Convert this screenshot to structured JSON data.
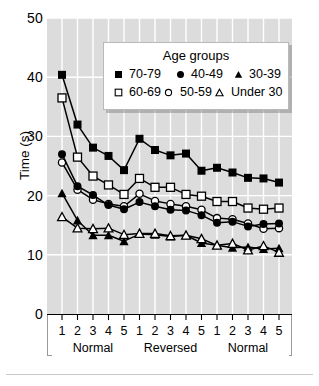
{
  "axes": {
    "ylabel": "Time (s)",
    "yticks": [
      "0",
      "10",
      "20",
      "30",
      "40",
      "50"
    ],
    "xticks": [
      "1",
      "2",
      "3",
      "4",
      "5",
      "1",
      "2",
      "3",
      "4",
      "5",
      "1",
      "2",
      "3",
      "4",
      "5"
    ],
    "xgroups": [
      "Normal",
      "Reversed",
      "Normal"
    ]
  },
  "legend": {
    "title": "Age groups",
    "items": [
      {
        "label": "70-79",
        "marker": "filled-square-marker"
      },
      {
        "label": "40-49",
        "marker": "filled-circle-marker"
      },
      {
        "label": "30-39",
        "marker": "filled-triangle-marker"
      },
      {
        "label": "60-69",
        "marker": "open-square-marker"
      },
      {
        "label": "50-59",
        "marker": "open-circle-marker"
      },
      {
        "label": "Under 30",
        "marker": "open-triangle-marker"
      }
    ]
  },
  "chart_data": {
    "type": "line",
    "title": "",
    "xlabel": "",
    "ylabel": "Time (s)",
    "ylim": [
      0,
      50
    ],
    "yticks": [
      0,
      10,
      20,
      30,
      40,
      50
    ],
    "grid": true,
    "legend_position": "upper-right-inset",
    "legend_title": "Age groups",
    "x": [
      "Normal 1",
      "Normal 2",
      "Normal 3",
      "Normal 4",
      "Normal 5",
      "Reversed 1",
      "Reversed 2",
      "Reversed 3",
      "Reversed 4",
      "Reversed 5",
      "Normal 1",
      "Normal 2",
      "Normal 3",
      "Normal 4",
      "Normal 5"
    ],
    "x_tick_labels": [
      "1",
      "2",
      "3",
      "4",
      "5",
      "1",
      "2",
      "3",
      "4",
      "5",
      "1",
      "2",
      "3",
      "4",
      "5"
    ],
    "x_group_labels": [
      "Normal",
      "Reversed",
      "Normal"
    ],
    "series": [
      {
        "name": "70-79",
        "marker": "filled-square",
        "values": [
          40.4,
          32.0,
          28.1,
          26.7,
          24.3,
          29.6,
          27.7,
          26.8,
          27.1,
          24.2,
          24.7,
          23.9,
          23.0,
          22.9,
          22.2
        ]
      },
      {
        "name": "60-69",
        "marker": "open-square",
        "values": [
          36.5,
          26.5,
          23.3,
          21.8,
          20.2,
          22.9,
          21.4,
          21.4,
          20.2,
          19.9,
          19.0,
          19.0,
          17.9,
          17.7,
          17.9
        ]
      },
      {
        "name": "50-59",
        "marker": "open-circle",
        "values": [
          25.6,
          21.0,
          19.3,
          18.6,
          18.2,
          20.3,
          19.1,
          18.6,
          18.2,
          17.6,
          16.2,
          16.0,
          15.3,
          14.4,
          14.5
        ]
      },
      {
        "name": "40-49",
        "marker": "filled-circle",
        "values": [
          27.0,
          21.6,
          20.1,
          18.4,
          17.7,
          18.9,
          18.2,
          17.6,
          17.5,
          16.7,
          15.4,
          15.6,
          14.8,
          15.2,
          15.3
        ]
      },
      {
        "name": "30-39",
        "marker": "filled-triangle",
        "values": [
          20.4,
          15.8,
          13.3,
          13.3,
          12.3,
          13.5,
          13.4,
          13.1,
          13.3,
          12.0,
          11.6,
          11.2,
          11.3,
          11.0,
          11.1
        ]
      },
      {
        "name": "Under 30",
        "marker": "open-triangle",
        "values": [
          16.4,
          14.5,
          14.4,
          14.5,
          13.4,
          13.6,
          13.6,
          13.2,
          13.3,
          12.7,
          11.6,
          11.9,
          10.8,
          11.5,
          10.4
        ]
      }
    ]
  },
  "style": {
    "plot_background": "#dcdcdc",
    "gridline_color": "#ffffff",
    "line_color": "#000000",
    "frame_color": "#9a9a9a",
    "legend_background": "#ffffff"
  }
}
